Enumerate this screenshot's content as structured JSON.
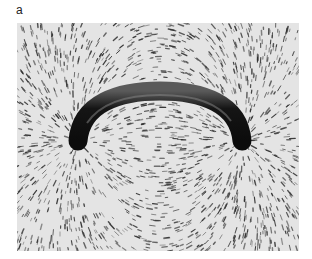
{
  "figure": {
    "panel_label": "a",
    "photo": {
      "subject": "iron filings around curved magnet",
      "alt": "Iron filings aligned along magnetic field lines around a curved horseshoe-shaped magnet"
    },
    "colors": {
      "background": "#e6e6e6",
      "magnet": "#141414",
      "filings": "#3a3a3a"
    }
  }
}
